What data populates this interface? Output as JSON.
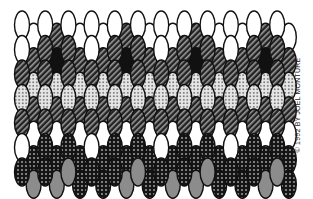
{
  "figure": {
    "type": "beadwork-pattern-illustration",
    "stitch": "peyote",
    "credit": "© 1992 BY JOEL MONTURE"
  },
  "legend": {
    "W": {
      "name": "white-bead",
      "fill": "#ffffff"
    },
    "S": {
      "name": "striped-bead",
      "fill": "#333333"
    },
    "D": {
      "name": "dark-dotted-bead",
      "fill": "#1a1a1a"
    },
    "L": {
      "name": "light-dotted-bead",
      "fill": "#d8d8d8"
    },
    "B": {
      "name": "black-bead",
      "fill": "#111111"
    },
    "G": {
      "name": "gray-bead",
      "fill": "#8a8a8a"
    }
  },
  "layout": {
    "x0": 22,
    "dx": 11.6,
    "y0": 25,
    "dy": 24.5,
    "rx": 7.5,
    "ry": 14,
    "offset": 12.25
  },
  "columns": [
    [
      "W",
      "W",
      "S",
      "L",
      "S",
      "W",
      "D"
    ],
    [
      "W",
      "S",
      "L",
      "S",
      "W",
      "D",
      "G"
    ],
    [
      "W",
      "S",
      "S",
      "L",
      "S",
      "D",
      "D"
    ],
    [
      "S",
      "B",
      "L",
      "S",
      "W",
      "D",
      "G"
    ],
    [
      "W",
      "S",
      "S",
      "L",
      "S",
      "D",
      "G"
    ],
    [
      "W",
      "S",
      "L",
      "S",
      "W",
      "D",
      "D"
    ],
    [
      "W",
      "W",
      "S",
      "L",
      "S",
      "W",
      "D"
    ],
    [
      "W",
      "S",
      "L",
      "S",
      "W",
      "D",
      "D"
    ],
    [
      "W",
      "S",
      "S",
      "L",
      "S",
      "D",
      "D"
    ],
    [
      "S",
      "B",
      "L",
      "S",
      "W",
      "D",
      "G"
    ],
    [
      "W",
      "S",
      "S",
      "L",
      "S",
      "D",
      "G"
    ],
    [
      "W",
      "S",
      "L",
      "S",
      "W",
      "D",
      "D"
    ],
    [
      "W",
      "W",
      "S",
      "L",
      "S",
      "W",
      "D"
    ],
    [
      "W",
      "S",
      "L",
      "S",
      "W",
      "D",
      "G"
    ],
    [
      "W",
      "S",
      "S",
      "L",
      "S",
      "D",
      "D"
    ],
    [
      "S",
      "B",
      "L",
      "S",
      "W",
      "D",
      "G"
    ],
    [
      "W",
      "S",
      "S",
      "L",
      "S",
      "D",
      "G"
    ],
    [
      "W",
      "S",
      "L",
      "S",
      "W",
      "D",
      "D"
    ],
    [
      "W",
      "W",
      "S",
      "L",
      "S",
      "W",
      "D"
    ],
    [
      "W",
      "S",
      "L",
      "S",
      "W",
      "D",
      "D"
    ],
    [
      "W",
      "S",
      "S",
      "L",
      "S",
      "D",
      "D"
    ],
    [
      "S",
      "B",
      "L",
      "S",
      "W",
      "D",
      "G"
    ],
    [
      "W",
      "S",
      "S",
      "L",
      "S",
      "D",
      "G"
    ],
    [
      "W",
      "S",
      "L",
      "S",
      "W",
      "D",
      "D"
    ]
  ]
}
